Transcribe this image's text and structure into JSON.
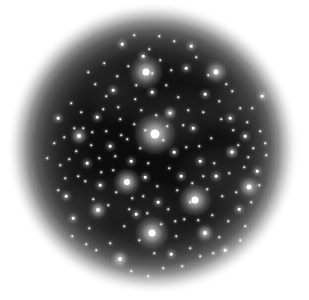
{
  "image": {
    "kind": "astronomical-star-field",
    "description": "Circular telescope field of view showing a dense star field with several bright stars surrounded by diffraction halos, fading radially into a white background",
    "width": 309,
    "height": 300,
    "background_color": "#ffffff",
    "sky_color": "#0b0b0b",
    "star_color": "#ffffff",
    "aperture": {
      "center_x": 153,
      "center_y": 148,
      "radius": 142,
      "falloff_start_radius": 110
    },
    "artifacts": {
      "vertical_striping": "true",
      "stripe_period_px": 4
    }
  },
  "chart_data": {
    "type": "scatter",
    "title": "",
    "xlabel": "",
    "ylabel": "",
    "xlim": [
      0,
      309
    ],
    "ylim": [
      0,
      300
    ],
    "grid": "false",
    "legend": "none",
    "series": [
      {
        "name": "bright-stars",
        "points": [
          {
            "x": 155,
            "y": 134,
            "mag": 1.0,
            "core": 9,
            "halo": 40
          },
          {
            "x": 146,
            "y": 72,
            "mag": 0.85,
            "core": 7,
            "halo": 32
          },
          {
            "x": 152,
            "y": 233,
            "mag": 0.85,
            "core": 7,
            "halo": 32
          },
          {
            "x": 195,
            "y": 200,
            "mag": 0.82,
            "core": 7,
            "halo": 31
          },
          {
            "x": 127,
            "y": 182,
            "mag": 0.74,
            "core": 6,
            "halo": 26
          },
          {
            "x": 216,
            "y": 72,
            "mag": 0.6,
            "core": 5,
            "halo": 20
          },
          {
            "x": 249,
            "y": 187,
            "mag": 0.55,
            "core": 5,
            "halo": 18
          },
          {
            "x": 98,
            "y": 210,
            "mag": 0.52,
            "core": 4,
            "halo": 16
          },
          {
            "x": 205,
            "y": 233,
            "mag": 0.5,
            "core": 4,
            "halo": 15
          },
          {
            "x": 120,
            "y": 259,
            "mag": 0.45,
            "core": 4,
            "halo": 14
          },
          {
            "x": 79,
            "y": 136,
            "mag": 0.45,
            "core": 4,
            "halo": 14
          },
          {
            "x": 170,
            "y": 113,
            "mag": 0.42,
            "core": 3,
            "halo": 12
          },
          {
            "x": 232,
            "y": 152,
            "mag": 0.4,
            "core": 3,
            "halo": 12
          }
        ]
      },
      {
        "name": "medium-stars",
        "points": [
          {
            "x": 113,
            "y": 90
          },
          {
            "x": 186,
            "y": 68
          },
          {
            "x": 205,
            "y": 94
          },
          {
            "x": 230,
            "y": 118
          },
          {
            "x": 245,
            "y": 136
          },
          {
            "x": 262,
            "y": 96
          },
          {
            "x": 97,
            "y": 117
          },
          {
            "x": 87,
            "y": 163
          },
          {
            "x": 110,
            "y": 146
          },
          {
            "x": 131,
            "y": 161
          },
          {
            "x": 174,
            "y": 152
          },
          {
            "x": 181,
            "y": 176
          },
          {
            "x": 200,
            "y": 161
          },
          {
            "x": 216,
            "y": 176
          },
          {
            "x": 239,
            "y": 209
          },
          {
            "x": 158,
            "y": 202
          },
          {
            "x": 136,
            "y": 214
          },
          {
            "x": 171,
            "y": 254
          },
          {
            "x": 100,
            "y": 185
          },
          {
            "x": 66,
            "y": 196
          },
          {
            "x": 73,
            "y": 218
          },
          {
            "x": 143,
            "y": 56
          },
          {
            "x": 122,
            "y": 44
          },
          {
            "x": 191,
            "y": 46
          },
          {
            "x": 225,
            "y": 250
          },
          {
            "x": 257,
            "y": 171
          },
          {
            "x": 58,
            "y": 118
          },
          {
            "x": 152,
            "y": 92
          },
          {
            "x": 193,
            "y": 128
          },
          {
            "x": 145,
            "y": 177
          }
        ]
      },
      {
        "name": "faint-stars",
        "points": [
          {
            "x": 88,
            "y": 72
          },
          {
            "x": 95,
            "y": 84
          },
          {
            "x": 104,
            "y": 63
          },
          {
            "x": 117,
            "y": 76
          },
          {
            "x": 128,
            "y": 66
          },
          {
            "x": 135,
            "y": 99
          },
          {
            "x": 141,
            "y": 110
          },
          {
            "x": 149,
            "y": 49
          },
          {
            "x": 160,
            "y": 60
          },
          {
            "x": 166,
            "y": 85
          },
          {
            "x": 174,
            "y": 41
          },
          {
            "x": 178,
            "y": 97
          },
          {
            "x": 183,
            "y": 125
          },
          {
            "x": 196,
            "y": 57
          },
          {
            "x": 203,
            "y": 112
          },
          {
            "x": 211,
            "y": 138
          },
          {
            "x": 219,
            "y": 101
          },
          {
            "x": 226,
            "y": 84
          },
          {
            "x": 233,
            "y": 130
          },
          {
            "x": 240,
            "y": 108
          },
          {
            "x": 247,
            "y": 122
          },
          {
            "x": 253,
            "y": 148
          },
          {
            "x": 260,
            "y": 131
          },
          {
            "x": 266,
            "y": 155
          },
          {
            "x": 71,
            "y": 103
          },
          {
            "x": 64,
            "y": 137
          },
          {
            "x": 76,
            "y": 151
          },
          {
            "x": 83,
            "y": 128
          },
          {
            "x": 91,
            "y": 145
          },
          {
            "x": 99,
            "y": 158
          },
          {
            "x": 106,
            "y": 131
          },
          {
            "x": 113,
            "y": 170
          },
          {
            "x": 120,
            "y": 119
          },
          {
            "x": 127,
            "y": 139
          },
          {
            "x": 134,
            "y": 124
          },
          {
            "x": 140,
            "y": 148
          },
          {
            "x": 148,
            "y": 163
          },
          {
            "x": 156,
            "y": 115
          },
          {
            "x": 163,
            "y": 140
          },
          {
            "x": 169,
            "y": 168
          },
          {
            "x": 177,
            "y": 190
          },
          {
            "x": 186,
            "y": 147
          },
          {
            "x": 192,
            "y": 183
          },
          {
            "x": 199,
            "y": 146
          },
          {
            "x": 207,
            "y": 189
          },
          {
            "x": 214,
            "y": 163
          },
          {
            "x": 222,
            "y": 196
          },
          {
            "x": 229,
            "y": 173
          },
          {
            "x": 236,
            "y": 192
          },
          {
            "x": 244,
            "y": 167
          },
          {
            "x": 251,
            "y": 202
          },
          {
            "x": 85,
            "y": 181
          },
          {
            "x": 93,
            "y": 199
          },
          {
            "x": 101,
            "y": 172
          },
          {
            "x": 108,
            "y": 205
          },
          {
            "x": 116,
            "y": 192
          },
          {
            "x": 124,
            "y": 226
          },
          {
            "x": 132,
            "y": 198
          },
          {
            "x": 139,
            "y": 240
          },
          {
            "x": 147,
            "y": 213
          },
          {
            "x": 154,
            "y": 253
          },
          {
            "x": 161,
            "y": 224
          },
          {
            "x": 168,
            "y": 209
          },
          {
            "x": 176,
            "y": 236
          },
          {
            "x": 184,
            "y": 219
          },
          {
            "x": 190,
            "y": 248
          },
          {
            "x": 198,
            "y": 220
          },
          {
            "x": 212,
            "y": 215
          },
          {
            "x": 219,
            "y": 237
          },
          {
            "x": 228,
            "y": 221
          },
          {
            "x": 110,
            "y": 243
          },
          {
            "x": 131,
            "y": 271
          },
          {
            "x": 148,
            "y": 276
          },
          {
            "x": 163,
            "y": 268
          },
          {
            "x": 182,
            "y": 266
          },
          {
            "x": 200,
            "y": 256
          },
          {
            "x": 89,
            "y": 228
          },
          {
            "x": 78,
            "y": 176
          },
          {
            "x": 69,
            "y": 159
          },
          {
            "x": 60,
            "y": 165
          },
          {
            "x": 54,
            "y": 143
          },
          {
            "x": 47,
            "y": 158
          },
          {
            "x": 252,
            "y": 108
          },
          {
            "x": 259,
            "y": 185
          },
          {
            "x": 245,
            "y": 226
          },
          {
            "x": 208,
            "y": 75
          },
          {
            "x": 159,
            "y": 36
          },
          {
            "x": 134,
            "y": 35
          },
          {
            "x": 106,
            "y": 96
          },
          {
            "x": 118,
            "y": 107
          },
          {
            "x": 152,
            "y": 73
          },
          {
            "x": 136,
            "y": 85
          },
          {
            "x": 171,
            "y": 70
          },
          {
            "x": 188,
            "y": 110
          },
          {
            "x": 221,
            "y": 119
          },
          {
            "x": 238,
            "y": 145
          },
          {
            "x": 65,
            "y": 178
          },
          {
            "x": 96,
            "y": 250
          },
          {
            "x": 115,
            "y": 156
          },
          {
            "x": 145,
            "y": 130
          },
          {
            "x": 167,
            "y": 126
          },
          {
            "x": 203,
            "y": 176
          },
          {
            "x": 190,
            "y": 202
          },
          {
            "x": 175,
            "y": 221
          },
          {
            "x": 157,
            "y": 186
          },
          {
            "x": 143,
            "y": 196
          },
          {
            "x": 129,
            "y": 209
          },
          {
            "x": 121,
            "y": 135
          },
          {
            "x": 103,
            "y": 109
          },
          {
            "x": 92,
            "y": 132
          },
          {
            "x": 81,
            "y": 112
          },
          {
            "x": 74,
            "y": 128
          },
          {
            "x": 232,
            "y": 91
          },
          {
            "x": 248,
            "y": 157
          },
          {
            "x": 265,
            "y": 143
          },
          {
            "x": 240,
            "y": 240
          },
          {
            "x": 213,
            "y": 253
          },
          {
            "x": 86,
            "y": 244
          },
          {
            "x": 72,
            "y": 236
          },
          {
            "x": 58,
            "y": 190
          }
        ]
      }
    ],
    "nebulosity": [
      {
        "x": 175,
        "y": 118,
        "rx": 46,
        "ry": 34,
        "opacity": 0.1
      },
      {
        "x": 212,
        "y": 176,
        "rx": 40,
        "ry": 36,
        "opacity": 0.09
      },
      {
        "x": 120,
        "y": 96,
        "rx": 36,
        "ry": 30,
        "opacity": 0.08
      },
      {
        "x": 150,
        "y": 210,
        "rx": 42,
        "ry": 32,
        "opacity": 0.08
      },
      {
        "x": 228,
        "y": 108,
        "rx": 30,
        "ry": 26,
        "opacity": 0.07
      },
      {
        "x": 100,
        "y": 200,
        "rx": 32,
        "ry": 28,
        "opacity": 0.07
      }
    ]
  }
}
